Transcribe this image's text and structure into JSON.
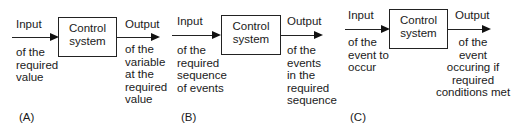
{
  "diagrams": [
    {
      "label": "(A)",
      "box": "Control\nsystem",
      "input_title": "Input",
      "input_desc": "of the\nrequired\nvalue",
      "output_title": "Output",
      "output_desc": "of the\nvariable\nat the\nrequired\nvalue"
    },
    {
      "label": "(B)",
      "box": "Control\nsystem",
      "input_title": "Input",
      "input_desc": "of the\nrequired\nsequence\nof events",
      "output_title": "Output",
      "output_desc": "of the\nevents\nin the\nrequired\nsequence"
    },
    {
      "label": "(C)",
      "box": "Control\nsystem",
      "input_title": "Input",
      "input_desc": "of  the\nevent to\noccur",
      "output_title": "Output",
      "output_desc": "of the\nevent\noccuring if\nrequired\nconditions met"
    }
  ]
}
